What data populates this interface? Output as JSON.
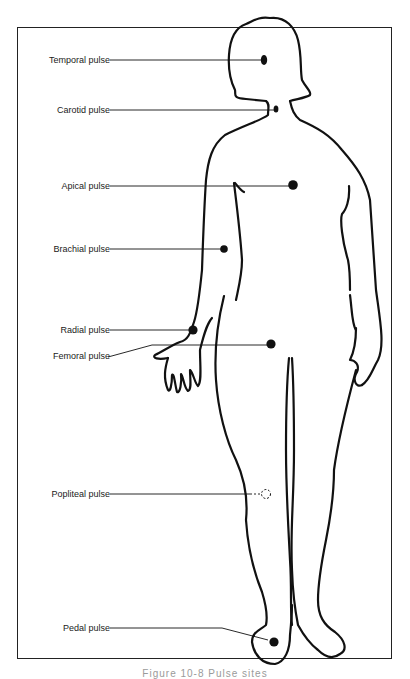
{
  "figure": {
    "caption": "Figure 10-8 Pulse sites",
    "labels": [
      {
        "id": "temporal",
        "text": "Temporal pulse",
        "y": 60
      },
      {
        "id": "carotid",
        "text": "Carotid pulse",
        "y": 110
      },
      {
        "id": "apical",
        "text": "Apical pulse",
        "y": 186
      },
      {
        "id": "brachial",
        "text": "Brachial pulse",
        "y": 249
      },
      {
        "id": "radial",
        "text": "Radial pulse",
        "y": 330
      },
      {
        "id": "femoral",
        "text": "Femoral pulse",
        "y": 356
      },
      {
        "id": "popliteal",
        "text": "Popliteal pulse",
        "y": 494
      },
      {
        "id": "pedal",
        "text": "Pedal pulse",
        "y": 628
      }
    ],
    "colors": {
      "line": "#111111",
      "dot": "#111111",
      "background": "#ffffff"
    }
  }
}
